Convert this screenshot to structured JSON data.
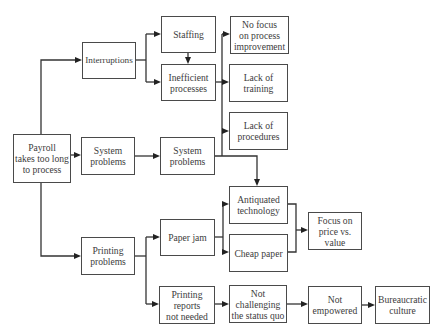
{
  "diagram": {
    "type": "cause-and-effect tree",
    "nodes": {
      "payroll": {
        "label": "Payroll\ntakes too long\nto process"
      },
      "interruptions": {
        "label": "Interruptions"
      },
      "system_problems_1": {
        "label": "System\nproblems"
      },
      "printing_problems": {
        "label": "Printing\nproblems"
      },
      "staffing": {
        "label": "Staffing"
      },
      "inefficient_processes": {
        "label": "Inefficient\nprocesses"
      },
      "system_problems_2": {
        "label": "System\nproblems"
      },
      "paper_jam": {
        "label": "Paper jam"
      },
      "printing_reports": {
        "label": "Printing\nreports\nnot needed"
      },
      "no_focus": {
        "label": "No focus\non process\nimprovement"
      },
      "lack_training": {
        "label": "Lack of\ntraining"
      },
      "lack_procedures": {
        "label": "Lack of\nprocedures"
      },
      "antiquated_technology": {
        "label": "Antiquated\ntechnology"
      },
      "cheap_paper": {
        "label": "Cheap paper"
      },
      "not_challenging": {
        "label": "Not\nchallenging\nthe status quo"
      },
      "focus_price": {
        "label": "Focus on\nprice vs.\nvalue"
      },
      "not_empowered": {
        "label": "Not\nempowered"
      },
      "bureaucratic_culture": {
        "label": "Bureaucratic\nculture"
      }
    },
    "edges": [
      [
        "payroll",
        "interruptions"
      ],
      [
        "payroll",
        "system_problems_1"
      ],
      [
        "payroll",
        "printing_problems"
      ],
      [
        "interruptions",
        "staffing"
      ],
      [
        "interruptions",
        "inefficient_processes"
      ],
      [
        "staffing",
        "inefficient_processes"
      ],
      [
        "inefficient_processes",
        "no_focus"
      ],
      [
        "inefficient_processes",
        "lack_training"
      ],
      [
        "inefficient_processes",
        "lack_procedures"
      ],
      [
        "system_problems_1",
        "system_problems_2"
      ],
      [
        "system_problems_2",
        "antiquated_technology"
      ],
      [
        "printing_problems",
        "paper_jam"
      ],
      [
        "printing_problems",
        "printing_reports"
      ],
      [
        "paper_jam",
        "antiquated_technology"
      ],
      [
        "paper_jam",
        "cheap_paper"
      ],
      [
        "antiquated_technology",
        "focus_price"
      ],
      [
        "cheap_paper",
        "focus_price"
      ],
      [
        "printing_reports",
        "not_challenging"
      ],
      [
        "not_challenging",
        "not_empowered"
      ],
      [
        "not_empowered",
        "bureaucratic_culture"
      ]
    ]
  }
}
